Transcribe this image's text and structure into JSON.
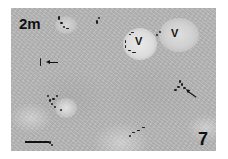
{
  "figure": {
    "panel_tag": "2m",
    "panel_number": "7",
    "vessel_labels": [
      "V",
      "V"
    ],
    "arrows": [
      {
        "direction": "left",
        "target": "stained-cell-left"
      },
      {
        "direction": "up-left",
        "target": "stained-cell-right"
      }
    ],
    "scale_bar": {
      "visible": true
    },
    "image_type": "grayscale micrograph"
  }
}
